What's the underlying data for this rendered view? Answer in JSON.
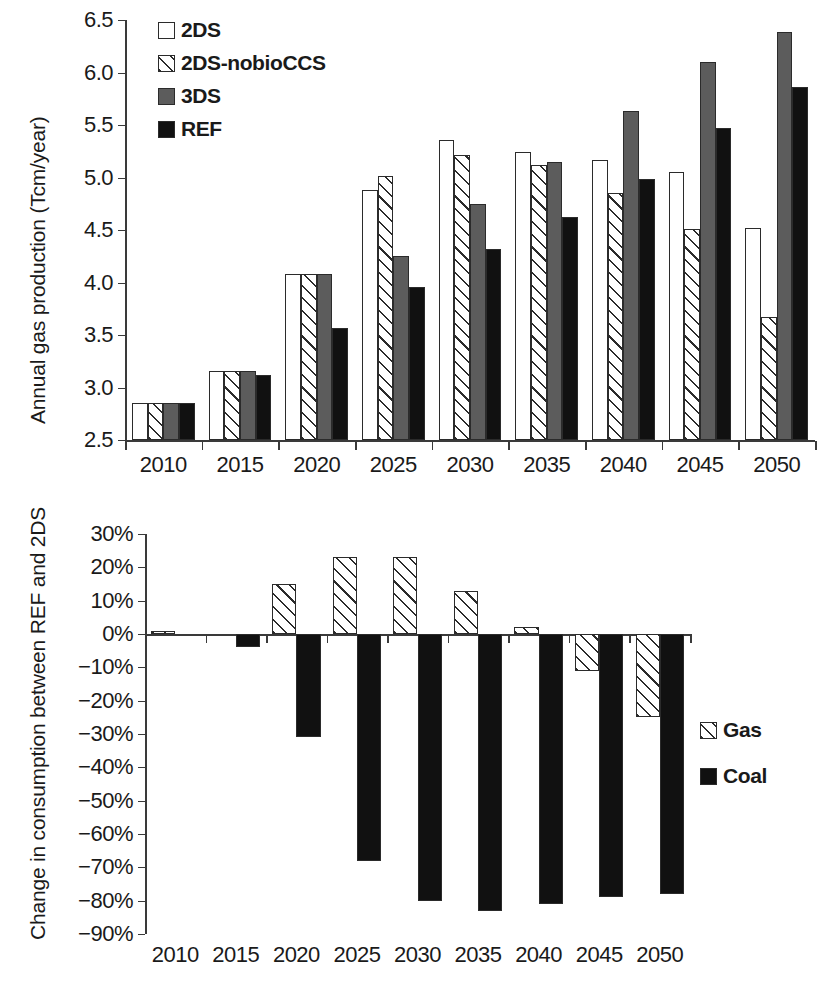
{
  "chart_data": [
    {
      "type": "bar",
      "id": "annual-gas-production",
      "title": "",
      "xlabel": "",
      "ylabel": "Annual gas production (Tcm/year)",
      "categories": [
        "2010",
        "2015",
        "2020",
        "2025",
        "2030",
        "2035",
        "2040",
        "2045",
        "2050"
      ],
      "ylim": [
        2.5,
        6.5
      ],
      "yticks": [
        "2.5",
        "3.0",
        "3.5",
        "4.0",
        "4.5",
        "5.0",
        "5.5",
        "6.0",
        "6.5"
      ],
      "ytick_values": [
        2.5,
        3.0,
        3.5,
        4.0,
        4.5,
        5.0,
        5.5,
        6.0,
        6.5
      ],
      "grid": false,
      "legend_position": "upper-left-inside",
      "series": [
        {
          "name": "2DS",
          "style": "white",
          "values": [
            2.85,
            3.16,
            4.08,
            4.88,
            5.36,
            5.24,
            5.17,
            5.05,
            4.52
          ]
        },
        {
          "name": "2DS-nobioCCS",
          "style": "hatch",
          "values": [
            2.85,
            3.16,
            4.08,
            5.01,
            5.21,
            5.12,
            4.85,
            4.51,
            3.67
          ]
        },
        {
          "name": "3DS",
          "style": "gray",
          "values": [
            2.85,
            3.16,
            4.08,
            4.25,
            4.75,
            5.15,
            5.63,
            6.1,
            6.39
          ]
        },
        {
          "name": "REF",
          "style": "black",
          "values": [
            2.85,
            3.12,
            3.57,
            3.96,
            4.32,
            4.62,
            4.99,
            5.47,
            5.86
          ]
        }
      ]
    },
    {
      "type": "bar",
      "id": "change-in-consumption",
      "title": "",
      "xlabel": "",
      "ylabel": "Change in consumption between REF and 2DS",
      "categories": [
        "2010",
        "2015",
        "2020",
        "2025",
        "2030",
        "2035",
        "2040",
        "2045",
        "2050"
      ],
      "ylim": [
        -90,
        30
      ],
      "yticks": [
        "30%",
        "20%",
        "10%",
        "0%",
        "−10%",
        "−20%",
        "−30%",
        "−40%",
        "−50%",
        "−60%",
        "−70%",
        "−80%",
        "−90%"
      ],
      "ytick_values": [
        30,
        20,
        10,
        0,
        -10,
        -20,
        -30,
        -40,
        -50,
        -60,
        -70,
        -80,
        -90
      ],
      "grid": false,
      "legend_position": "right-middle",
      "series": [
        {
          "name": "Gas",
          "style": "hatch",
          "values": [
            1,
            0,
            15,
            23,
            23,
            13,
            2,
            -11,
            -25
          ]
        },
        {
          "name": "Coal",
          "style": "black",
          "values": [
            0,
            -4,
            -31,
            -68,
            -80,
            -83,
            -81,
            -79,
            -78
          ]
        }
      ]
    }
  ]
}
